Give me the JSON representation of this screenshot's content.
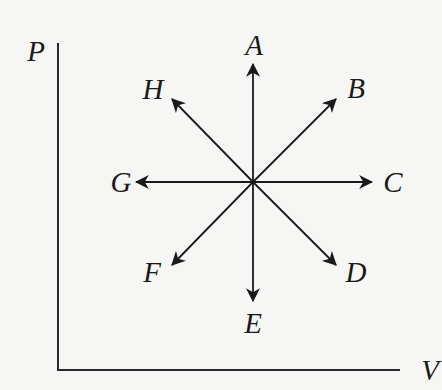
{
  "diagram": {
    "type": "pv-diagram-process-directions",
    "axes": {
      "y_label": "P",
      "x_label": "V"
    },
    "center": {
      "x": 253,
      "y": 182
    },
    "directions": [
      {
        "id": "A",
        "label": "A",
        "direction": "up"
      },
      {
        "id": "B",
        "label": "B",
        "direction": "up-right"
      },
      {
        "id": "C",
        "label": "C",
        "direction": "right"
      },
      {
        "id": "D",
        "label": "D",
        "direction": "down-right"
      },
      {
        "id": "E",
        "label": "E",
        "direction": "down"
      },
      {
        "id": "F",
        "label": "F",
        "direction": "down-left"
      },
      {
        "id": "G",
        "label": "G",
        "direction": "left"
      },
      {
        "id": "H",
        "label": "H",
        "direction": "up-left"
      }
    ],
    "colors": {
      "ink": "#1a1a1a",
      "background": "#f6f6f4"
    }
  }
}
